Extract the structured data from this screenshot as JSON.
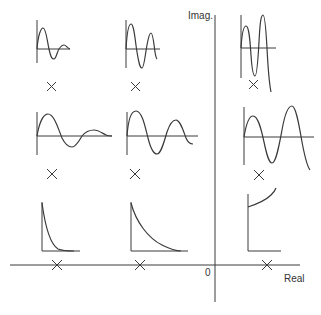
{
  "diagram": {
    "axes": {
      "imag_label": "Imag.",
      "real_label": "Real",
      "origin_label": "0"
    },
    "colors": {
      "stroke": "#3a3a3a",
      "background": "#ffffff"
    },
    "pole_marker": "×",
    "panels": [
      {
        "id": "top-left",
        "row": "top",
        "col": "left-far",
        "response": "decaying oscillation (high frequency)"
      },
      {
        "id": "top-center",
        "row": "top",
        "col": "left-near",
        "response": "slowly decaying oscillation (high frequency)"
      },
      {
        "id": "top-right",
        "row": "top",
        "col": "right",
        "response": "growing oscillation (high frequency)"
      },
      {
        "id": "middle-left",
        "row": "middle",
        "col": "left-far",
        "response": "decaying oscillation (low frequency)"
      },
      {
        "id": "middle-center",
        "row": "middle",
        "col": "left-near",
        "response": "slowly decaying oscillation (low frequency)"
      },
      {
        "id": "middle-right",
        "row": "middle",
        "col": "right",
        "response": "growing oscillation (low frequency)"
      },
      {
        "id": "bottom-left",
        "row": "real-axis",
        "col": "left-far",
        "response": "fast exponential decay"
      },
      {
        "id": "bottom-center",
        "row": "real-axis",
        "col": "left-near",
        "response": "slow exponential decay"
      },
      {
        "id": "bottom-right",
        "row": "real-axis",
        "col": "right",
        "response": "exponential growth"
      }
    ]
  }
}
